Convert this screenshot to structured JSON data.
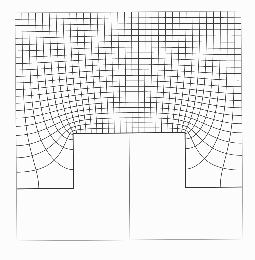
{
  "figure": {
    "type": "curvilinear-grid-diagram",
    "background": "#fcfcfc",
    "rotation_deg": -0.5,
    "outer_frame": {
      "x": 16,
      "y": 12,
      "width": 226,
      "height": 228,
      "color": "#a0a0a0",
      "line_width": 0.6
    },
    "grid_region": {
      "x": 16,
      "y": 12,
      "width": 226,
      "height": 176
    },
    "rib": {
      "x": 73,
      "y": 133,
      "width": 112,
      "height": 55,
      "outline_color": "#2e2e2e",
      "outline_width": 0.9
    },
    "ledge_y": 188,
    "symmetry_line": {
      "x": 129,
      "y_top": 133,
      "y_bottom": 240,
      "color": "#6e6e6e",
      "line_width": 0.6
    },
    "mesh": {
      "n_vertical_lines": 32,
      "n_horizontal_lines": 21,
      "color": "#3a3a3a",
      "line_width": 0.55
    }
  }
}
